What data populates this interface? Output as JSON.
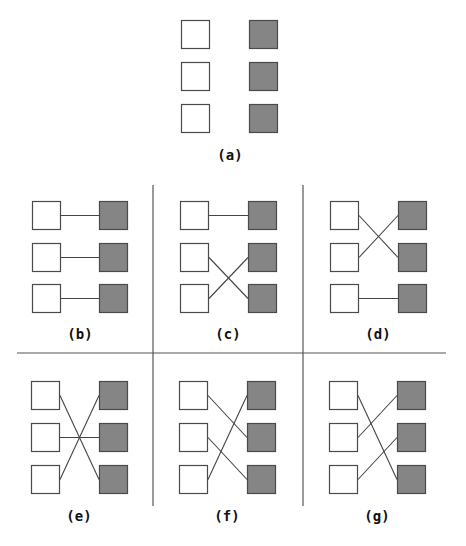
{
  "figure": {
    "colors": {
      "left_fill": "#ffffff",
      "right_fill": "#858585",
      "stroke": "#4a4a4a",
      "line": "#444444",
      "divider": "#555555"
    },
    "panels": [
      {
        "id": "a",
        "label": "(a)",
        "connections": []
      },
      {
        "id": "b",
        "label": "(b)",
        "connections": [
          [
            1,
            1
          ],
          [
            2,
            2
          ],
          [
            3,
            3
          ]
        ]
      },
      {
        "id": "c",
        "label": "(c)",
        "connections": [
          [
            1,
            1
          ],
          [
            2,
            3
          ],
          [
            3,
            2
          ]
        ]
      },
      {
        "id": "d",
        "label": "(d)",
        "connections": [
          [
            1,
            2
          ],
          [
            2,
            1
          ],
          [
            3,
            3
          ]
        ]
      },
      {
        "id": "e",
        "label": "(e)",
        "connections": [
          [
            1,
            3
          ],
          [
            2,
            2
          ],
          [
            3,
            1
          ]
        ]
      },
      {
        "id": "f",
        "label": "(f)",
        "connections": [
          [
            1,
            2
          ],
          [
            2,
            3
          ],
          [
            3,
            1
          ]
        ]
      },
      {
        "id": "g",
        "label": "(g)",
        "connections": [
          [
            1,
            3
          ],
          [
            2,
            1
          ],
          [
            3,
            2
          ]
        ]
      }
    ]
  }
}
